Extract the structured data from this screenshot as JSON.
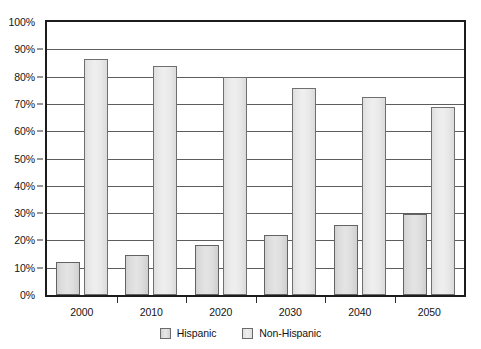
{
  "chart_data": {
    "type": "bar",
    "title": "",
    "subtitle": "",
    "xlabel": "",
    "ylabel": "",
    "categories": [
      "2000",
      "2010",
      "2020",
      "2030",
      "2040",
      "2050"
    ],
    "series": [
      {
        "name": "Hispanic",
        "values": [
          12,
          14.5,
          18.5,
          22,
          25.5,
          29.5
        ]
      },
      {
        "name": "Non-Hispanic",
        "values": [
          86.5,
          84,
          80,
          76,
          72.5,
          69
        ]
      }
    ],
    "ylim": [
      0,
      100
    ],
    "ytick_labels": [
      "0%",
      "10%",
      "20%",
      "30%",
      "40%",
      "50%",
      "60%",
      "70%",
      "80%",
      "90%",
      "100%"
    ],
    "ytick_values": [
      0,
      10,
      20,
      30,
      40,
      50,
      60,
      70,
      80,
      90,
      100
    ],
    "grid": true,
    "grid_axis": "y",
    "legend_position": "bottom",
    "legend_entries": [
      "Hispanic",
      "Non-Hispanic"
    ],
    "annotations": [],
    "colors": {
      "hispanic_fill": "#dcdcdc",
      "nonhispanic_fill": "#e9e9e9",
      "bar_border": "#6b6b6b",
      "gridline": "#5d5d5d",
      "frame": "#1c1c1c",
      "text": "#141414",
      "background": "#ffffff"
    }
  }
}
